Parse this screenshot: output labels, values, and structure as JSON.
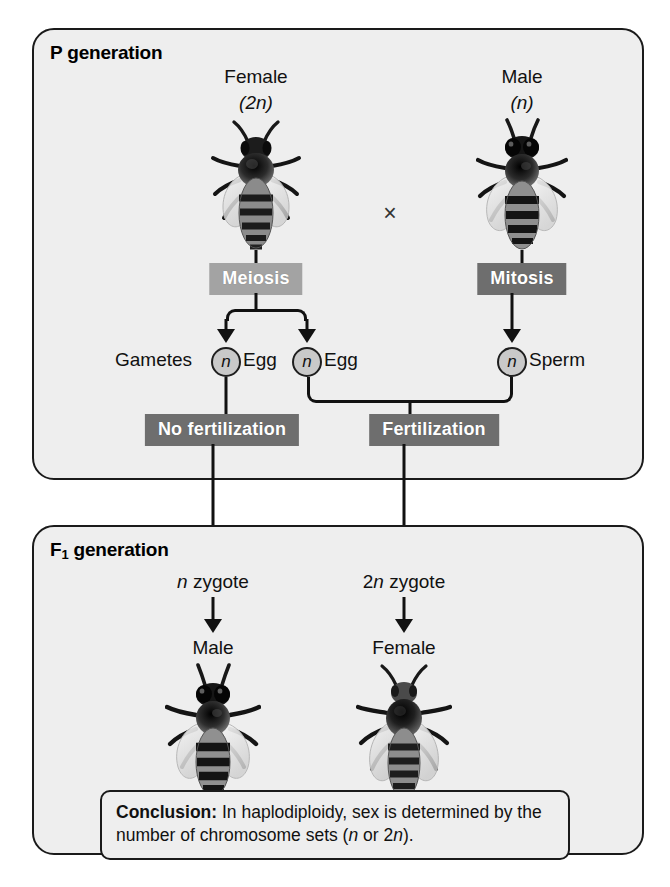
{
  "figure": {
    "panels": {
      "p": {
        "title_main": "P",
        "title_sub": "1",
        "title_rest": " generation"
      },
      "f1": {
        "title_main": "F",
        "title_sub": "1",
        "title_rest": " generation"
      }
    },
    "p_generation": {
      "female_label": "Female",
      "female_ploidy": "(2n)",
      "male_label": "Male",
      "male_ploidy": "(n)",
      "cross_symbol": "×",
      "meiosis_label": "Meiosis",
      "mitosis_label": "Mitosis",
      "gametes_label": "Gametes",
      "gamete_symbol": "n",
      "egg_label_1": "Egg",
      "egg_label_2": "Egg",
      "sperm_label": "Sperm",
      "no_fertilization_label": "No fertilization",
      "fertilization_label": "Fertilization"
    },
    "f1_generation": {
      "zygote_left": "n zygote",
      "zygote_right": "2n zygote",
      "offspring_left": "Male",
      "offspring_right": "Female"
    },
    "conclusion": {
      "heading": "Conclusion:",
      "text": " In haplodiploidy, sex is determined by the number of chromosome sets (n or 2n)."
    },
    "colors": {
      "panel_fill": "#eeeeee",
      "panel_border": "#1a1a1a",
      "meiosis_box": "#a3a3a3",
      "mitosis_box": "#6e6e6e",
      "fertilization_box": "#6e6e6e",
      "line": "#111111",
      "gamete_circle_fill": "#c9c9c9"
    }
  }
}
